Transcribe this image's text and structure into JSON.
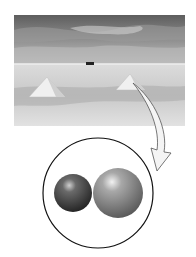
{
  "figure": {
    "photo": {
      "subject": "salt-flats-landscape",
      "elements": [
        "cloudy-sky",
        "horizon",
        "vehicle",
        "salt-pile-left",
        "salt-pile-right"
      ]
    },
    "magnifier": {
      "shape": "circle",
      "contents": [
        {
          "name": "small-sphere",
          "color": "#3a3a3a"
        },
        {
          "name": "large-sphere",
          "color": "#8a8a8a"
        }
      ]
    },
    "arrow": {
      "from": "salt-pile-right",
      "to": "magnifier",
      "style": "curved-outline"
    }
  },
  "colors": {
    "sky_dark": "#6a6a6a",
    "sky_light": "#bdbdbd",
    "ground": "#d6d6d6",
    "circle_stroke": "#111111",
    "background": "#ffffff"
  }
}
